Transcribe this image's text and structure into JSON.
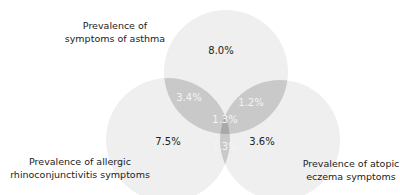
{
  "diagram": {
    "type": "venn-3",
    "sets": [
      {
        "id": "asthma",
        "label_line1": "Prevalence of",
        "label_line2": "symptoms of asthma",
        "only_pct": "8.0%"
      },
      {
        "id": "rhino",
        "label_line1": "Prevalence of allergic",
        "label_line2": "rhinoconjunctivitis symptoms",
        "only_pct": "7.5%"
      },
      {
        "id": "eczema",
        "label_line1": "Prevalence of atopic",
        "label_line2": "eczema symptoms",
        "only_pct": "3.6%"
      }
    ],
    "intersections": {
      "asthma_rhino": "3.4%",
      "asthma_eczema": "1.2%",
      "rhino_eczema": "1.3%",
      "all_three": "1.3%"
    },
    "colors": {
      "single": "#efefef",
      "double": "#c9c9c9",
      "triple": "#a9a9a9",
      "text_dark": "#222222",
      "text_light": "#f4f4f4"
    }
  }
}
